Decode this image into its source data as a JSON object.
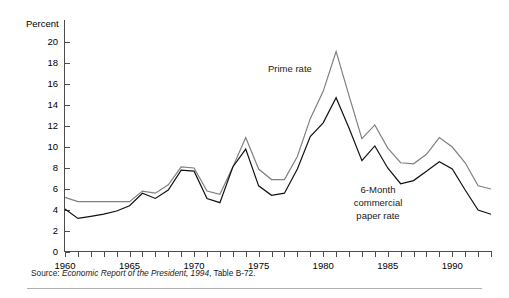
{
  "figure": {
    "y_axis_title": "Percent",
    "source_label": "Source:",
    "source_title": "Economic Report of the President, 1994",
    "source_tail": ", Table B-72."
  },
  "annotations": {
    "prime": "Prime rate",
    "commercial_line1": "6-Month",
    "commercial_line2": "commercial",
    "commercial_line3": "paper rate"
  },
  "colors": {
    "prime_rate_line": "#808080",
    "commercial_paper_line": "#111111",
    "axis": "#4d4d4d",
    "text": "#1a1a1a",
    "background": "#ffffff",
    "rule": "#b0b0b0"
  },
  "chart_data": {
    "type": "line",
    "title": "",
    "subtitle": "",
    "xlabel": "",
    "ylabel": "Percent",
    "xlim": [
      1960,
      1993
    ],
    "ylim": [
      0,
      20
    ],
    "ytick_step": 2,
    "xtick_step": 1,
    "grid": false,
    "legend_position": "inline-annotation",
    "ytick_labels": [
      "0",
      "2",
      "4",
      "6",
      "8",
      "10",
      "12",
      "14",
      "16",
      "18",
      "20"
    ],
    "ytick_values": [
      0,
      2,
      4,
      6,
      8,
      10,
      12,
      14,
      16,
      18,
      20
    ],
    "xtick_labels": [
      "1960",
      "1965",
      "1970",
      "1975",
      "1980",
      "1985",
      "1990"
    ],
    "xtick_values": [
      1960,
      1965,
      1970,
      1975,
      1980,
      1985,
      1990
    ],
    "x": [
      1960,
      1961,
      1962,
      1963,
      1964,
      1965,
      1966,
      1967,
      1968,
      1969,
      1970,
      1971,
      1972,
      1973,
      1974,
      1975,
      1976,
      1977,
      1978,
      1979,
      1980,
      1981,
      1982,
      1983,
      1984,
      1985,
      1986,
      1987,
      1988,
      1989,
      1990,
      1991,
      1992,
      1993
    ],
    "series": [
      {
        "name": "Prime rate",
        "color": "#808080",
        "values": [
          5.2,
          4.8,
          4.8,
          4.8,
          4.8,
          4.8,
          5.8,
          5.6,
          6.4,
          8.1,
          8.0,
          5.8,
          5.5,
          8.1,
          10.9,
          7.9,
          6.9,
          6.9,
          9.1,
          12.7,
          15.3,
          19.1,
          14.9,
          10.8,
          12.1,
          9.9,
          8.5,
          8.4,
          9.3,
          10.9,
          10.0,
          8.5,
          6.3,
          6.0
        ]
      },
      {
        "name": "6-Month commercial paper rate",
        "color": "#111111",
        "values": [
          4.1,
          3.2,
          3.4,
          3.6,
          3.9,
          4.4,
          5.6,
          5.1,
          5.9,
          7.8,
          7.7,
          5.1,
          4.7,
          8.1,
          9.8,
          6.3,
          5.4,
          5.6,
          7.9,
          11.0,
          12.3,
          14.7,
          11.8,
          8.7,
          10.1,
          8.0,
          6.5,
          6.8,
          7.7,
          8.6,
          7.9,
          5.9,
          4.0,
          3.6
        ]
      }
    ],
    "annotations": [
      {
        "text": "Prime rate",
        "x": 1978.5,
        "y": 17.4
      },
      {
        "text": "6-Month commercial paper rate",
        "x": 1986.5,
        "y": 5.2
      }
    ],
    "source": "Source: Economic Report of the President, 1994, Table B-72."
  }
}
